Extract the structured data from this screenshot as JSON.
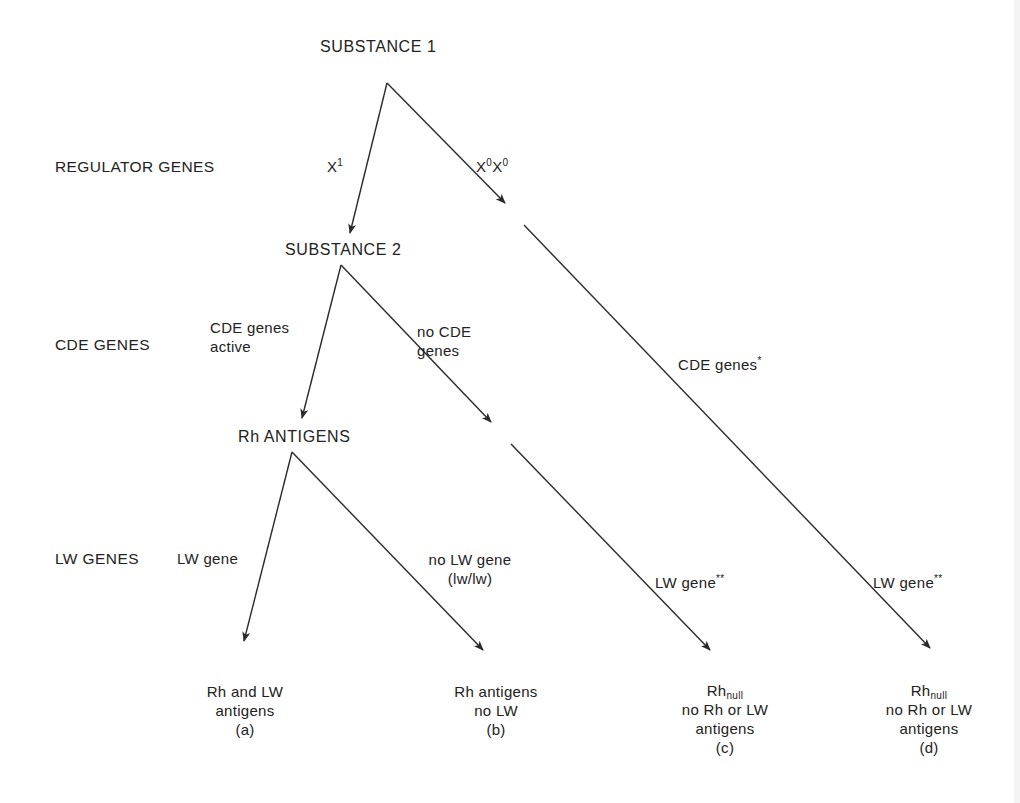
{
  "diagram": {
    "type": "flow-tree",
    "nodes": {
      "substance1": "SUBSTANCE 1",
      "substance2": "SUBSTANCE 2",
      "rh_antigens": "Rh ANTIGENS"
    },
    "row_labels": {
      "regulator": "REGULATOR GENES",
      "cde": "CDE GENES",
      "lw": "LW GENES"
    },
    "edge_labels": {
      "x1": {
        "base": "X",
        "sup": "1"
      },
      "x0x0": {
        "base1": "X",
        "sup1": "0",
        "base2": "X",
        "sup2": "0"
      },
      "cde_active": {
        "line1": "CDE genes",
        "line2": "active"
      },
      "no_cde": {
        "line1": "no CDE",
        "line2": "genes"
      },
      "cde_star": {
        "text": "CDE genes",
        "sup": "*"
      },
      "lw_gene": "LW gene",
      "no_lw": {
        "line1": "no LW gene",
        "line2": "(lw/lw)"
      },
      "lw_gene_c": {
        "text": "LW gene",
        "sup": "**"
      },
      "lw_gene_d": {
        "text": "LW gene",
        "sup": "**"
      }
    },
    "outcomes": [
      {
        "id": "a",
        "lines": [
          "Rh and LW",
          "antigens",
          "(a)"
        ]
      },
      {
        "id": "b",
        "lines": [
          "Rh antigens",
          "no LW",
          "(b)"
        ]
      },
      {
        "id": "c",
        "title_base": "Rh",
        "title_sub": "null",
        "lines": [
          "no Rh or LW",
          "antigens",
          "(c)"
        ]
      },
      {
        "id": "d",
        "title_base": "Rh",
        "title_sub": "null",
        "lines": [
          "no Rh or LW",
          "antigens",
          "(d)"
        ]
      }
    ],
    "colors": {
      "line": "#2a2a2a",
      "text": "#222222",
      "background": "#ffffff"
    }
  }
}
